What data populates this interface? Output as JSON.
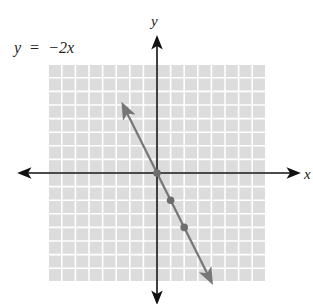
{
  "chart_data": {
    "type": "line",
    "title": "",
    "equation_label": "y = −2x",
    "equation_parts": {
      "lhs": "y",
      "eq": "=",
      "rhs": "−2x"
    },
    "xlabel": "x",
    "ylabel": "y",
    "xlim": [
      -8,
      8
    ],
    "ylim": [
      -8,
      8
    ],
    "grid": true,
    "series": [
      {
        "name": "y = -2x",
        "slope": -2,
        "intercept": 0,
        "x": [
          -2.5,
          4.0
        ],
        "values": [
          5.0,
          -8.0
        ]
      }
    ],
    "points": [
      {
        "x": 0,
        "y": 0
      },
      {
        "x": 1,
        "y": -2
      },
      {
        "x": 2,
        "y": -4
      }
    ]
  },
  "colors": {
    "grid_fill": "#dcdcdc",
    "grid_line": "#ffffff",
    "axis": "#111111",
    "line": "#777777",
    "point": "#6e6e6e",
    "text": "#222222"
  },
  "labels": {
    "x_axis": "x",
    "y_axis": "y",
    "equation_y": "y",
    "equation_eq": "=",
    "equation_rhs": "−2x"
  }
}
